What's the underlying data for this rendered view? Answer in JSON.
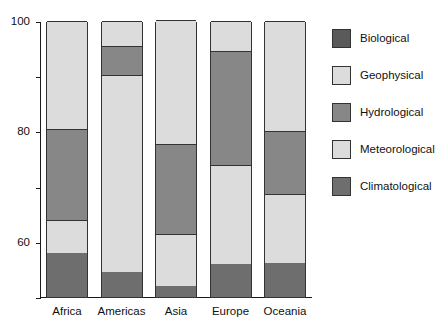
{
  "chart_data": {
    "type": "bar",
    "subtype": "stacked-percentage",
    "title": "",
    "xlabel": "",
    "ylabel": "",
    "ylim": [
      0,
      100
    ],
    "yticks": [
      0,
      20,
      40,
      60,
      80,
      100
    ],
    "ytick_labels": [
      "0",
      "20",
      "40",
      "60",
      "80",
      "100"
    ],
    "grid": false,
    "legend_position": "right",
    "categories": [
      "Africa",
      "Americas",
      "Asia",
      "Europe",
      "Oceania"
    ],
    "stack_order_bottom_to_top": [
      "Climatological",
      "Meteorological",
      "Hydrological",
      "Geophysical",
      "Biological"
    ],
    "series": [
      {
        "name": "Climatological",
        "color": "#6e6e6e",
        "values": [
          16,
          9,
          4,
          12,
          12.5
        ]
      },
      {
        "name": "Meteorological",
        "color": "#dcdcdc",
        "values": [
          12,
          71.5,
          19,
          36,
          25
        ]
      },
      {
        "name": "Hydrological",
        "color": "#878787",
        "values": [
          33,
          10.5,
          32.5,
          41,
          22.5
        ]
      },
      {
        "name": "Geophysical",
        "color": "#dcdcdc",
        "values": [
          39,
          9,
          45,
          11,
          40
        ]
      },
      {
        "name": "Biological",
        "color": "#5a5a5a",
        "values": [
          0,
          0,
          0,
          0,
          0
        ]
      }
    ],
    "cumulative_boundaries": {
      "Africa": [
        16,
        28,
        61,
        100,
        100
      ],
      "Americas": [
        9,
        80.5,
        91,
        100,
        100
      ],
      "Asia": [
        4,
        23,
        55.5,
        100,
        100
      ],
      "Europe": [
        12,
        48,
        89,
        100,
        100
      ],
      "Oceania": [
        12.5,
        37.5,
        60,
        100,
        100
      ]
    }
  },
  "legend": {
    "items": [
      {
        "label": "Biological",
        "color": "#5a5a5a"
      },
      {
        "label": "Geophysical",
        "color": "#dcdcdc"
      },
      {
        "label": "Hydrological",
        "color": "#878787"
      },
      {
        "label": "Meteorological",
        "color": "#dcdcdc"
      },
      {
        "label": "Climatological",
        "color": "#6e6e6e"
      }
    ]
  },
  "axes": {
    "y_tick_labels": [
      "100",
      "80",
      "60",
      "40",
      "20",
      "0"
    ],
    "x_tick_labels": [
      "Africa",
      "Americas",
      "Asia",
      "Europe",
      "Oceania"
    ]
  },
  "colors": {
    "axis": "#1a1a1a",
    "segment_border": "#333333",
    "background": "#ffffff"
  }
}
